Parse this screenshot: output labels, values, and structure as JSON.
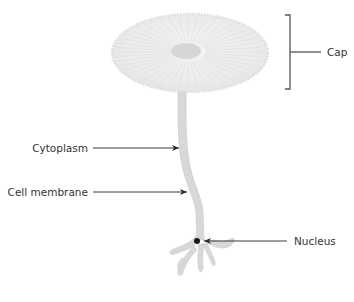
{
  "diagram": {
    "labels": {
      "cap": "Cap",
      "cytoplasm": "Cytoplasm",
      "cell_membrane": "Cell membrane",
      "nucleus": "Nucleus"
    },
    "colors": {
      "cell_fill": "#d9d9d9",
      "cap_fill": "#eeeeee",
      "cap_center": "#d4d4d4",
      "leader_line": "#3a3a3a",
      "bracket": "#555555",
      "nucleus": "#1a1a1a",
      "text": "#333333"
    }
  }
}
